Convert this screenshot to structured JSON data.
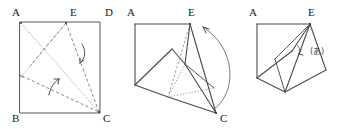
{
  "figure": {
    "background_color": "#ffffff",
    "stroke_color": "#555555",
    "label_color": "#1a1a1a",
    "panels": [
      {
        "id": "panel-flat-square",
        "caption": "",
        "vertex_labels": [
          {
            "name": "A",
            "text": "A",
            "x": 12,
            "y": 16
          },
          {
            "name": "E",
            "text": "E",
            "x": 70,
            "y": 16
          },
          {
            "name": "D",
            "text": "D",
            "x": 105,
            "y": 16
          },
          {
            "name": "B",
            "text": "B",
            "x": 12,
            "y": 122
          },
          {
            "name": "C",
            "text": "C",
            "x": 103,
            "y": 122
          }
        ]
      },
      {
        "id": "panel-partial-fold",
        "caption": "",
        "vertex_labels": [
          {
            "name": "A",
            "text": "A",
            "x": 127,
            "y": 16
          },
          {
            "name": "E",
            "text": "E",
            "x": 188,
            "y": 16
          },
          {
            "name": "C",
            "text": "C",
            "x": 220,
            "y": 122
          }
        ]
      },
      {
        "id": "panel-folded-solid",
        "caption": "",
        "vertex_labels": [
          {
            "name": "A",
            "text": "A",
            "x": 249,
            "y": 16
          },
          {
            "name": "E",
            "text": "E",
            "x": 308,
            "y": 16
          }
        ],
        "angle_annotations": [
          {
            "name": "angle-a",
            "text": "(あ)",
            "x": 312,
            "y": 52
          }
        ]
      }
    ]
  }
}
